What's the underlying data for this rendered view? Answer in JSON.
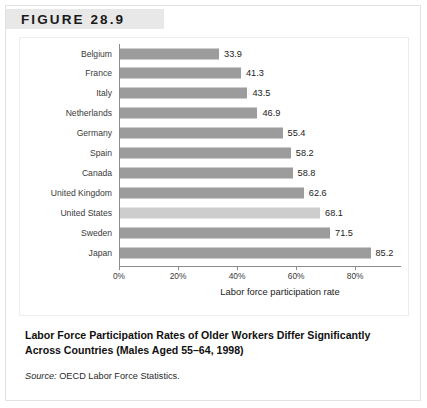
{
  "figure": {
    "label": "FIGURE 28.9",
    "caption": "Labor Force Participation Rates of Older Workers Differ Significantly Across Countries (Males Aged 55–64, 1998)",
    "source_prefix": "Source:",
    "source_text": " OECD Labor Force Statistics."
  },
  "colors": {
    "bar": "#9c9c9c",
    "bar_highlight": "#cdcdcd",
    "band": "#e8e8e8",
    "axis": "#8c8c8c"
  },
  "chart_data": {
    "type": "bar",
    "orientation": "horizontal",
    "title": "Labor Force Participation Rates of Older Workers Differ Significantly Across Countries (Males Aged 55–64, 1998)",
    "xlabel": "Labor force participation rate",
    "ylabel": "",
    "xlim": [
      0,
      95.6
    ],
    "grid": false,
    "legend": false,
    "highlighted_category": "United States",
    "xticks": [
      0,
      20,
      40,
      60,
      80
    ],
    "xtick_labels": [
      "0%",
      "20%",
      "40%",
      "60%",
      "80%"
    ],
    "categories": [
      "Belgium",
      "France",
      "Italy",
      "Netherlands",
      "Germany",
      "Spain",
      "Canada",
      "United Kingdom",
      "United States",
      "Sweden",
      "Japan"
    ],
    "values": [
      33.9,
      41.3,
      43.5,
      46.9,
      55.4,
      58.2,
      58.8,
      62.6,
      68.1,
      71.5,
      85.2
    ],
    "value_labels": [
      "33.9",
      "41.3",
      "43.5",
      "46.9",
      "55.4",
      "58.2",
      "58.8",
      "62.6",
      "68.1",
      "71.5",
      "85.2"
    ]
  }
}
